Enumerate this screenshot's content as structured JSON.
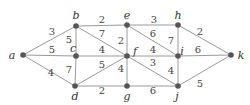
{
  "graph": {
    "nodes": [
      {
        "id": "a",
        "label": "a",
        "x": 23,
        "y": 55,
        "lx": 12,
        "ly": 59
      },
      {
        "id": "b",
        "label": "b",
        "x": 76,
        "y": 26,
        "lx": 76,
        "ly": 19
      },
      {
        "id": "c",
        "label": "c",
        "x": 76,
        "y": 56,
        "lx": 73,
        "ly": 52
      },
      {
        "id": "d",
        "label": "d",
        "x": 75,
        "y": 86,
        "lx": 75,
        "ly": 100
      },
      {
        "id": "e",
        "label": "e",
        "x": 127,
        "y": 25,
        "lx": 127,
        "ly": 19
      },
      {
        "id": "f",
        "label": "f",
        "x": 127,
        "y": 56,
        "lx": 135,
        "ly": 55
      },
      {
        "id": "g",
        "label": "g",
        "x": 127,
        "y": 86,
        "lx": 127,
        "ly": 100
      },
      {
        "id": "h",
        "label": "h",
        "x": 178,
        "y": 25,
        "lx": 178,
        "ly": 19
      },
      {
        "id": "i",
        "label": "i",
        "x": 178,
        "y": 56,
        "lx": 182,
        "ly": 55
      },
      {
        "id": "j",
        "label": "j",
        "x": 178,
        "y": 86,
        "lx": 177,
        "ly": 100
      },
      {
        "id": "k",
        "label": "k",
        "x": 231,
        "y": 55,
        "lx": 241,
        "ly": 59
      }
    ],
    "edges": [
      {
        "from": "a",
        "to": "b",
        "weight": "3",
        "wx": 52,
        "wy": 35
      },
      {
        "from": "a",
        "to": "c",
        "weight": "5",
        "wx": 52,
        "wy": 53
      },
      {
        "from": "a",
        "to": "d",
        "weight": "4",
        "wx": 51,
        "wy": 76
      },
      {
        "from": "b",
        "to": "c",
        "weight": "5",
        "wx": 69,
        "wy": 43
      },
      {
        "from": "b",
        "to": "e",
        "weight": "2",
        "wx": 102,
        "wy": 23
      },
      {
        "from": "b",
        "to": "f",
        "weight": "7",
        "wx": 102,
        "wy": 37
      },
      {
        "from": "c",
        "to": "f",
        "weight": "4",
        "wx": 102,
        "wy": 53
      },
      {
        "from": "c",
        "to": "d",
        "weight": "7",
        "wx": 69,
        "wy": 73
      },
      {
        "from": "d",
        "to": "f",
        "weight": "5",
        "wx": 102,
        "wy": 68
      },
      {
        "from": "d",
        "to": "g",
        "weight": "2",
        "wx": 102,
        "wy": 94
      },
      {
        "from": "e",
        "to": "f",
        "weight": "2",
        "wx": 121,
        "wy": 44
      },
      {
        "from": "e",
        "to": "h",
        "weight": "3",
        "wx": 154,
        "wy": 23
      },
      {
        "from": "e",
        "to": "i",
        "weight": "6",
        "wx": 153,
        "wy": 37
      },
      {
        "from": "f",
        "to": "g",
        "weight": "4",
        "wx": 121,
        "wy": 72
      },
      {
        "from": "f",
        "to": "i",
        "weight": "4",
        "wx": 153,
        "wy": 53
      },
      {
        "from": "f",
        "to": "j",
        "weight": "3",
        "wx": 153,
        "wy": 66
      },
      {
        "from": "g",
        "to": "j",
        "weight": "6",
        "wx": 153,
        "wy": 94
      },
      {
        "from": "h",
        "to": "i",
        "weight": "7",
        "wx": 171,
        "wy": 44
      },
      {
        "from": "h",
        "to": "k",
        "weight": "2",
        "wx": 200,
        "wy": 35
      },
      {
        "from": "i",
        "to": "k",
        "weight": "6",
        "wx": 198,
        "wy": 53
      },
      {
        "from": "i",
        "to": "j",
        "weight": "4",
        "wx": 171,
        "wy": 74
      },
      {
        "from": "j",
        "to": "k",
        "weight": "5",
        "wx": 200,
        "wy": 87
      }
    ]
  }
}
